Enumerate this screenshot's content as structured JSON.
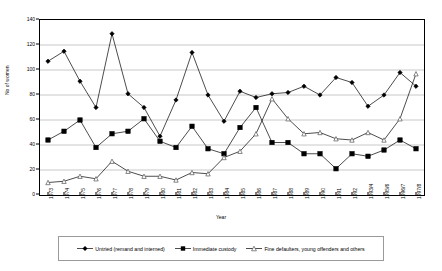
{
  "chart_data": {
    "type": "line",
    "title": "",
    "xlabel": "Year",
    "ylabel": "No of women",
    "ylim": [
      0,
      140
    ],
    "yticks": [
      0,
      20,
      40,
      60,
      80,
      100,
      120,
      140
    ],
    "grid": true,
    "legend_position": "bottom",
    "categories": [
      "1973",
      "1974",
      "1975",
      "1976",
      "1977",
      "1978",
      "1979",
      "1980",
      "1981",
      "1982",
      "1983",
      "1984",
      "1985",
      "1986",
      "1987",
      "1988",
      "1989",
      "1990",
      "1991",
      "1992",
      "1993/4",
      "1995/6",
      "1996/7",
      "1997/8"
    ],
    "series": [
      {
        "name": "Untried (remand and interned)",
        "marker": "diamond",
        "values": [
          107,
          115,
          91,
          70,
          129,
          81,
          70,
          47,
          76,
          114,
          80,
          59,
          83,
          78,
          81,
          82,
          87,
          80,
          94,
          90,
          71,
          80,
          98,
          87
        ]
      },
      {
        "name": "Immediate custody",
        "marker": "square",
        "values": [
          44,
          51,
          60,
          38,
          49,
          51,
          61,
          43,
          38,
          55,
          37,
          33,
          54,
          70,
          42,
          42,
          33,
          33,
          21,
          33,
          31,
          36,
          44,
          37
        ]
      },
      {
        "name": "Fine defaulters, young offenders and others",
        "marker": "triangle",
        "values": [
          10,
          11,
          15,
          13,
          27,
          19,
          15,
          15,
          12,
          18,
          17,
          30,
          35,
          49,
          77,
          61,
          49,
          50,
          45,
          44,
          50,
          44,
          61,
          97
        ]
      }
    ]
  },
  "legend": {
    "items": [
      {
        "label": "Untried (remand and interned)",
        "marker": "diamond-marker-icon"
      },
      {
        "label": "Immediate custody",
        "marker": "square-marker-icon"
      },
      {
        "label": "Fine defaulters, young offenders and others",
        "marker": "triangle-marker-icon"
      }
    ]
  },
  "colors": {
    "series_line": "#000000",
    "grid": "#c8c8c8",
    "axis": "#000000",
    "background": "#ffffff",
    "legend_border": "#9a9a9a"
  }
}
